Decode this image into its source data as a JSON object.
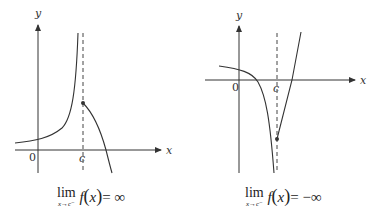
{
  "graphs": [
    {
      "id": "left",
      "axes": {
        "x_label": "x",
        "y_label": "y",
        "origin_label": "0",
        "c_label": "c"
      },
      "caption": {
        "lim_word": "lim",
        "lim_sub": "x→c⁻",
        "f": "f",
        "open": "(",
        "var": "x",
        "close": ")",
        "rhs": "= ∞"
      }
    },
    {
      "id": "right",
      "axes": {
        "x_label": "x",
        "y_label": "y",
        "origin_label": "0",
        "c_label": "c"
      },
      "caption": {
        "lim_word": "lim",
        "lim_sub": "x→c⁻",
        "f": "f",
        "open": "(",
        "var": "x",
        "close": ")",
        "rhs": "= −∞"
      }
    }
  ],
  "colors": {
    "curve": "#333333",
    "axis": "#333333",
    "dashed": "#444444"
  }
}
